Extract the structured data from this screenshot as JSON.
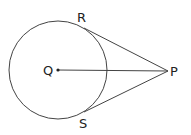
{
  "diagram": {
    "labels": {
      "R": "R",
      "Q": "Q",
      "P": "P",
      "S": "S"
    },
    "colors": {
      "stroke": "#333333",
      "text": "#222222"
    }
  }
}
